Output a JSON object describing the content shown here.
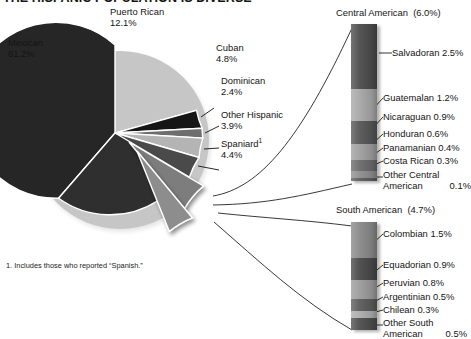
{
  "title": "THE HISPANIC POPULATION IS DIVERSE",
  "footnote": "1.  Includes those who reported “Spanish.”",
  "pie": {
    "labels": {
      "mexican": {
        "name": "Mexican",
        "value": "61.2%"
      },
      "puerto_rican": {
        "name": "Puerto Rican",
        "value": "12.1%"
      },
      "cuban": {
        "name": "Cuban",
        "value": "4.8%"
      },
      "dominican": {
        "name": "Dominican",
        "value": "2.4%"
      },
      "other_hispanic": {
        "name": "Other Hispanic",
        "value": "3.9%"
      },
      "spaniard": {
        "name": "Spaniard",
        "value": "4.4%",
        "footnote_marker": "1"
      }
    }
  },
  "central_american": {
    "heading": "Central American",
    "heading_value": "(6.0%)",
    "items": [
      {
        "label": "Salvadoran",
        "value": "2.5%",
        "pct": 2.5,
        "shade": "#4d4d4d"
      },
      {
        "label": "Guatemalan",
        "value": "1.2%",
        "pct": 1.2,
        "shade": "#a8a8a8"
      },
      {
        "label": "Nicaraguan",
        "value": "0.9%",
        "pct": 0.9,
        "shade": "#575757"
      },
      {
        "label": "Honduran",
        "value": "0.6%",
        "pct": 0.6,
        "shade": "#a0a0a0"
      },
      {
        "label": "Panamanian",
        "value": "0.4%",
        "pct": 0.4,
        "shade": "#6b6b6b"
      },
      {
        "label": "Costa Rican",
        "value": "0.3%",
        "pct": 0.3,
        "shade": "#8f8f8f"
      },
      {
        "label": "Other Central American",
        "value": "0.1%",
        "pct": 0.1,
        "shade": "#5e5e5e"
      }
    ]
  },
  "south_american": {
    "heading": "South American",
    "heading_value": "(4.7%)",
    "items": [
      {
        "label": "Colombian",
        "value": "1.5%",
        "pct": 1.5,
        "shade": "#8a8a8a"
      },
      {
        "label": "Equadorian",
        "value": "0.9%",
        "pct": 0.9,
        "shade": "#4a4a4a"
      },
      {
        "label": "Peruvian",
        "value": "0.8%",
        "pct": 0.8,
        "shade": "#9c9c9c"
      },
      {
        "label": "Argentinian",
        "value": "0.5%",
        "pct": 0.5,
        "shade": "#5c5c5c"
      },
      {
        "label": "Chilean",
        "value": "0.3%",
        "pct": 0.3,
        "shade": "#aeaeae"
      },
      {
        "label": "Other South American",
        "value": "0.5%",
        "pct": 0.5,
        "shade": "#4f4f4f"
      }
    ]
  },
  "chart_data": {
    "type": "pie",
    "title": "THE HISPANIC POPULATION IS DIVERSE",
    "units": "percent of total Hispanic population",
    "categories": [
      "Mexican",
      "Puerto Rican",
      "Cuban",
      "Dominican",
      "Other Hispanic",
      "Spaniard",
      "Central American",
      "South American"
    ],
    "values": [
      61.2,
      12.1,
      4.8,
      2.4,
      3.9,
      4.4,
      6.0,
      4.7
    ],
    "exploded": [
      "Central American",
      "South American"
    ],
    "legend": "none",
    "breakouts": [
      {
        "type": "bar",
        "parent": "Central American",
        "parent_value": 6.0,
        "orientation": "vertical-stacked",
        "categories": [
          "Salvadoran",
          "Guatemalan",
          "Nicaraguan",
          "Honduran",
          "Panamanian",
          "Costa Rican",
          "Other Central American"
        ],
        "values": [
          2.5,
          1.2,
          0.9,
          0.6,
          0.4,
          0.3,
          0.1
        ]
      },
      {
        "type": "bar",
        "parent": "South American",
        "parent_value": 4.7,
        "orientation": "vertical-stacked",
        "categories": [
          "Colombian",
          "Equadorian",
          "Peruvian",
          "Argentinian",
          "Chilean",
          "Other South American"
        ],
        "values": [
          1.5,
          0.9,
          0.8,
          0.5,
          0.3,
          0.5
        ]
      }
    ]
  }
}
